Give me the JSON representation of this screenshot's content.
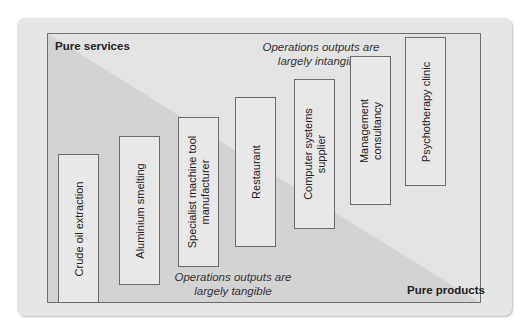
{
  "diagram": {
    "corner_labels": {
      "top_left": "Pure services",
      "bottom_right": "Pure products"
    },
    "annotations": {
      "top": [
        "Operations outputs are",
        "largely intangible"
      ],
      "bottom": [
        "Operations outputs are",
        "largely tangible"
      ]
    },
    "items": [
      {
        "label": "Crude oil extraction"
      },
      {
        "label": "Aluminium smelting"
      },
      {
        "label": "Specialist machine tool\nmanufacturer",
        "line1": "Specialist machine tool",
        "line2": "manufacturer"
      },
      {
        "label": "Restaurant"
      },
      {
        "label": "Computer systems\nsupplier",
        "line1": "Computer systems",
        "line2": "supplier"
      },
      {
        "label": "Management\nconsultancy",
        "line1": "Management",
        "line2": "consultancy"
      },
      {
        "label": "Psychotherapy clinic"
      }
    ],
    "colors": {
      "panel": "#e6e6e6",
      "inner_light": "#e2e2e2",
      "inner_dark": "#d2d2d2",
      "box_fill": "#e8e8e8",
      "stroke": "#6b6b6b"
    }
  }
}
